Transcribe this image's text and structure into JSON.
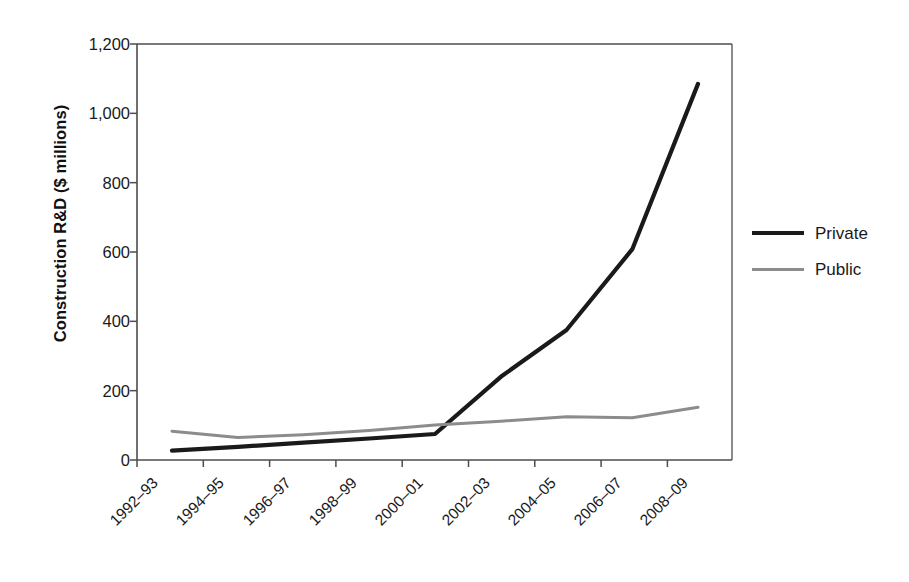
{
  "chart_data": {
    "type": "line",
    "title": "",
    "xlabel": "",
    "ylabel": "Construction R&D ($ millions)",
    "categories": [
      "1992–93",
      "1994–95",
      "1996–97",
      "1998–99",
      "2000–01",
      "2002–03",
      "2004–05",
      "2006–07",
      "2008–09"
    ],
    "series": [
      {
        "name": "Private",
        "color": "#1a1a1a",
        "values": [
          27,
          38,
          50,
          62,
          75,
          240,
          375,
          608,
          1085
        ]
      },
      {
        "name": "Public",
        "color": "#8c8c8c",
        "values": [
          83,
          65,
          73,
          85,
          101,
          112,
          125,
          122,
          152
        ]
      }
    ],
    "ylim": [
      0,
      1200
    ],
    "ytick_values": [
      0,
      200,
      400,
      600,
      800,
      1000,
      1200
    ],
    "ytick_labels": [
      "0",
      "200",
      "400",
      "600",
      "800",
      "1,000",
      "1,200"
    ],
    "grid": false,
    "legend_position": "right"
  },
  "legend": {
    "entries": [
      {
        "label": "Private",
        "icon": "line-swatch-dark"
      },
      {
        "label": "Public",
        "icon": "line-swatch-gray"
      }
    ]
  },
  "colors": {
    "private": "#1a1a1a",
    "public": "#8c8c8c",
    "axis": "#4d4d4d",
    "background": "#ffffff"
  }
}
